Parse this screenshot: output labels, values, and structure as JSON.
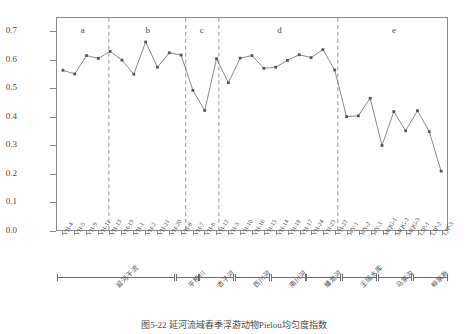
{
  "chart_data": {
    "type": "line",
    "title": "图5-22  延河流域春季浮游动物Pielou均匀度指数",
    "xlabel": "",
    "ylabel": "Pielou均匀度指数",
    "ylim": [
      0.0,
      0.75
    ],
    "y_ticks": [
      "0.0",
      "0.1",
      "0.2",
      "0.3",
      "0.4",
      "0.5",
      "0.6",
      "0.7"
    ],
    "y_tick_values": [
      0.0,
      0.1,
      0.2,
      0.3,
      0.4,
      0.5,
      0.6,
      0.7
    ],
    "grid": false,
    "legend_position": "none",
    "marker": "filled-square",
    "line_color": "#6b6b6b",
    "marker_color": "#555555",
    "categories": [
      "YH-4",
      "YH-5",
      "YH-9",
      "YH-11",
      "YH-13",
      "YH-19",
      "YH-1",
      "YH-2",
      "YH-21",
      "YH-20",
      "YH-8",
      "YH-7",
      "YH-6",
      "YH-12",
      "YH-3",
      "YH-10",
      "YH-16",
      "YH-15",
      "YH-14",
      "YH-18",
      "YH-17",
      "YH-24",
      "YH-23",
      "YH-22",
      "WY-1",
      "WY-2",
      "WY-3",
      "MQG-1",
      "MQG-2",
      "MQG-3",
      "LJP-1",
      "LJP-2",
      "LJP-3"
    ],
    "values": [
      0.565,
      0.552,
      0.617,
      0.607,
      0.632,
      0.601,
      0.551,
      0.665,
      0.576,
      0.627,
      0.619,
      0.494,
      0.423,
      0.606,
      0.521,
      0.608,
      0.617,
      0.572,
      0.576,
      0.6,
      0.62,
      0.61,
      0.638,
      0.566,
      0.401,
      0.404,
      0.466,
      0.299,
      0.419,
      0.351,
      0.422,
      0.348,
      0.208
    ],
    "annotations": [
      {
        "label": "a",
        "x_frac": 0.068
      },
      {
        "label": "b",
        "x_frac": 0.234
      },
      {
        "label": "c",
        "x_frac": 0.372
      },
      {
        "label": "d",
        "x_frac": 0.57
      },
      {
        "label": "e",
        "x_frac": 0.862
      }
    ],
    "cluster_dividers_x_frac": [
      0.133,
      0.33,
      0.415,
      0.72
    ],
    "groups": [
      {
        "label": "延河干流",
        "start_index": 0,
        "end_index": 9
      },
      {
        "label": "平桥川",
        "start_index": 10,
        "end_index": 11
      },
      {
        "label": "杏子河",
        "start_index": 12,
        "end_index": 14
      },
      {
        "label": "西川河",
        "start_index": 15,
        "end_index": 17
      },
      {
        "label": "南川河",
        "start_index": 18,
        "end_index": 20
      },
      {
        "label": "蟠龙河",
        "start_index": 21,
        "end_index": 23
      },
      {
        "label": "王瑶水库",
        "start_index": 24,
        "end_index": 26
      },
      {
        "label": "马家沟",
        "start_index": 27,
        "end_index": 29
      },
      {
        "label": "柳家新",
        "start_index": 30,
        "end_index": 32
      }
    ]
  }
}
